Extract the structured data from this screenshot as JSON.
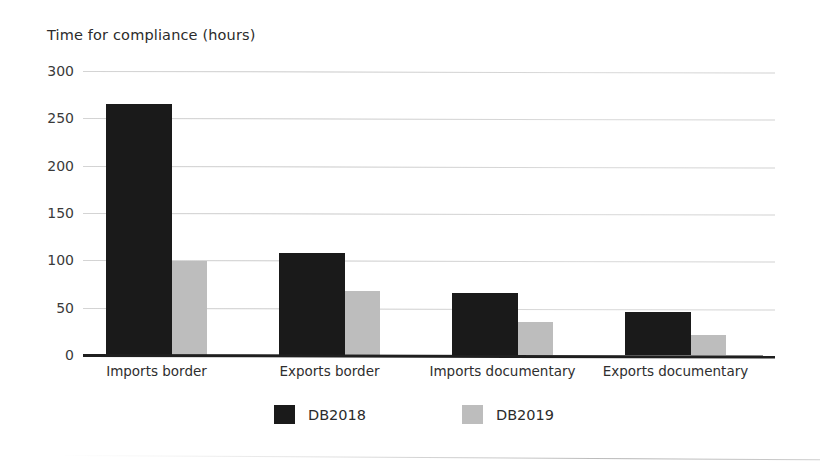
{
  "chart_data": {
    "type": "bar",
    "title": "Time for compliance (hours)",
    "xlabel": "",
    "ylabel": "Time for compliance (hours)",
    "ylim": [
      0,
      300
    ],
    "yticks": [
      0,
      50,
      100,
      150,
      200,
      250,
      300
    ],
    "ytick_labels": [
      "0",
      "50",
      "100",
      "150",
      "200",
      "250",
      "300"
    ],
    "grid": true,
    "legend_position": "bottom",
    "categories": [
      "Imports border",
      "Exports border",
      "Imports documentary",
      "Exports documentary"
    ],
    "series": [
      {
        "name": "DB2018",
        "color": "#1a1a1a",
        "values": [
          265,
          108,
          66,
          45
        ]
      },
      {
        "name": "DB2019",
        "color": "#bdbdbd",
        "values": [
          99,
          68,
          35,
          21
        ]
      }
    ]
  },
  "legend": {
    "items": [
      {
        "label": "DB2018",
        "color": "#1a1a1a"
      },
      {
        "label": "DB2019",
        "color": "#bdbdbd"
      }
    ]
  },
  "colors": {
    "db2018": "#1a1a1a",
    "db2019": "#bdbdbd",
    "gridline": "#cfcfcf",
    "axis": "#1f1f1f",
    "text": "#2b2b2b",
    "background": "#ffffff"
  }
}
